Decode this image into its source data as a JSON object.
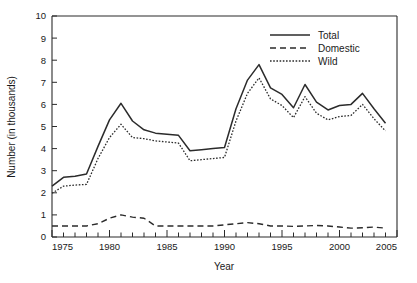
{
  "chart_data": {
    "type": "line",
    "title": "",
    "xlabel": "Year",
    "ylabel": "Number (in thousands)",
    "xlim": [
      1975,
      2005
    ],
    "ylim": [
      0,
      10
    ],
    "grid": false,
    "legend_position": "top-right",
    "x_tick_labels": [
      "1975",
      "1980",
      "1985",
      "1990",
      "1995",
      "2000",
      "2005"
    ],
    "x_tick_values": [
      1975,
      1980,
      1985,
      1990,
      1995,
      2000,
      2005
    ],
    "x_minor_step": 1,
    "y_tick_labels": [
      "0",
      "1",
      "2",
      "3",
      "4",
      "5",
      "6",
      "7",
      "8",
      "9",
      "10"
    ],
    "y_tick_values": [
      0,
      1,
      2,
      3,
      4,
      5,
      6,
      7,
      8,
      9,
      10
    ],
    "x": [
      1975,
      1976,
      1977,
      1978,
      1979,
      1980,
      1981,
      1982,
      1983,
      1984,
      1985,
      1986,
      1987,
      1988,
      1989,
      1990,
      1991,
      1992,
      1993,
      1994,
      1995,
      1996,
      1997,
      1998,
      1999,
      2000,
      2001,
      2002,
      2003,
      2004
    ],
    "series": [
      {
        "name": "Total",
        "style": "solid",
        "values": [
          2.3,
          2.7,
          2.75,
          2.85,
          4.1,
          5.3,
          6.05,
          5.25,
          4.85,
          4.7,
          4.65,
          4.6,
          3.9,
          3.95,
          4.0,
          4.05,
          5.8,
          7.1,
          7.8,
          6.75,
          6.45,
          5.85,
          6.9,
          6.1,
          5.75,
          5.95,
          6.0,
          6.5,
          5.8,
          5.15
        ]
      },
      {
        "name": "Domestic",
        "style": "dashed",
        "values": [
          0.5,
          0.5,
          0.5,
          0.5,
          0.6,
          0.85,
          1.0,
          0.9,
          0.85,
          0.5,
          0.5,
          0.5,
          0.5,
          0.5,
          0.5,
          0.55,
          0.6,
          0.65,
          0.6,
          0.5,
          0.5,
          0.48,
          0.5,
          0.52,
          0.5,
          0.45,
          0.4,
          0.42,
          0.45,
          0.4
        ]
      },
      {
        "name": "Wild",
        "style": "dotted",
        "values": [
          1.98,
          2.3,
          2.35,
          2.38,
          3.55,
          4.5,
          5.1,
          4.5,
          4.45,
          4.35,
          4.3,
          4.25,
          3.45,
          3.5,
          3.55,
          3.6,
          5.25,
          6.5,
          7.2,
          6.25,
          5.95,
          5.4,
          6.35,
          5.6,
          5.3,
          5.45,
          5.5,
          6.0,
          5.35,
          4.8
        ]
      }
    ],
    "legend": [
      {
        "label": "Total",
        "style": "solid"
      },
      {
        "label": "Domestic",
        "style": "dashed"
      },
      {
        "label": "Wild",
        "style": "dotted"
      }
    ],
    "colors": {
      "line": "#2b2b2b",
      "axis": "#2b2b2b",
      "background": "#ffffff"
    }
  }
}
